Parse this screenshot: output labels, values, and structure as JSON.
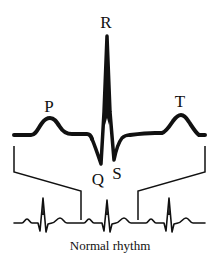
{
  "diagram": {
    "caption": "Normal rhythm",
    "colors": {
      "stroke": "#111111",
      "background": "#ffffff"
    },
    "labels": {
      "P": "P",
      "Q": "Q",
      "R": "R",
      "S": "S",
      "T": "T"
    },
    "components": [
      {
        "name": "P wave",
        "label": "P"
      },
      {
        "name": "Q wave",
        "label": "Q"
      },
      {
        "name": "R wave",
        "label": "R"
      },
      {
        "name": "S wave",
        "label": "S"
      },
      {
        "name": "T wave",
        "label": "T"
      }
    ],
    "rhythm_strip": {
      "beats": 3,
      "caption": "Normal rhythm"
    }
  }
}
